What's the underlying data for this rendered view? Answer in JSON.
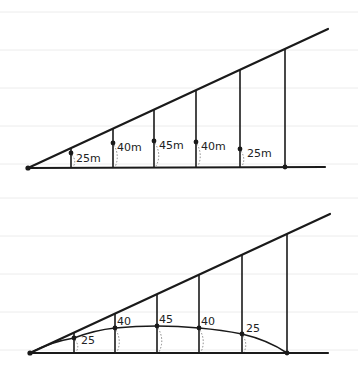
{
  "diagram_top": {
    "labels": [
      "25m",
      "40m",
      "45m",
      "40m",
      "25m"
    ]
  },
  "diagram_bottom": {
    "labels": [
      "25",
      "40",
      "45",
      "40",
      "25"
    ]
  },
  "colors": {
    "ink": "#1a1a1a",
    "ruled": "#ececec",
    "background": "#ffffff"
  }
}
